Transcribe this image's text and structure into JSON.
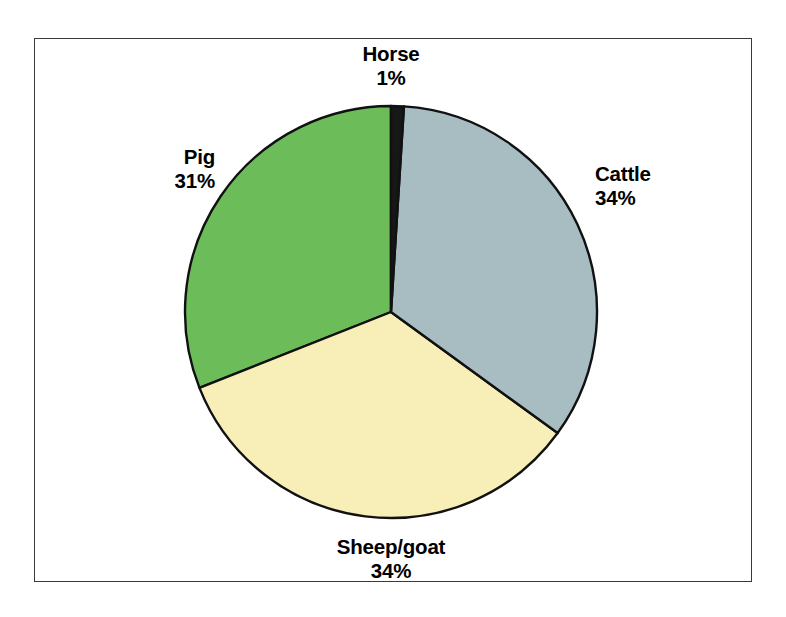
{
  "chart_data": {
    "type": "pie",
    "title": "",
    "subtitle": "",
    "xlabel": "",
    "ylabel": "",
    "legend_position": "none",
    "grid": false,
    "labels_show_percent": true,
    "start_angle_deg": 0,
    "direction": "clockwise",
    "categories": [
      "Horse",
      "Cattle",
      "Sheep/goat",
      "Pig"
    ],
    "values": [
      1,
      34,
      34,
      31
    ],
    "unit": "%",
    "slices": [
      {
        "name": "Horse",
        "value": 1,
        "percent_label": "1%",
        "color": "#171717",
        "start_deg": 0,
        "end_deg": 3.6
      },
      {
        "name": "Cattle",
        "value": 34,
        "percent_label": "34%",
        "color": "#a8bdc2",
        "start_deg": 3.6,
        "end_deg": 126
      },
      {
        "name": "Sheep/goat",
        "value": 34,
        "percent_label": "34%",
        "color": "#f7eeb8",
        "start_deg": 126,
        "end_deg": 248.4
      },
      {
        "name": "Pig",
        "value": 31,
        "percent_label": "31%",
        "color": "#6cbc5a",
        "start_deg": 248.4,
        "end_deg": 360
      }
    ]
  },
  "labels": {
    "horse": {
      "name": "Horse",
      "value": "1%"
    },
    "cattle": {
      "name": "Cattle",
      "value": "34%"
    },
    "pig": {
      "name": "Pig",
      "value": "31%"
    },
    "sheepgoat": {
      "name": "Sheep/goat",
      "value": "34%"
    }
  },
  "style": {
    "outline_color": "#111111",
    "frame_color": "#3a3a3a",
    "background": "#ffffff"
  }
}
